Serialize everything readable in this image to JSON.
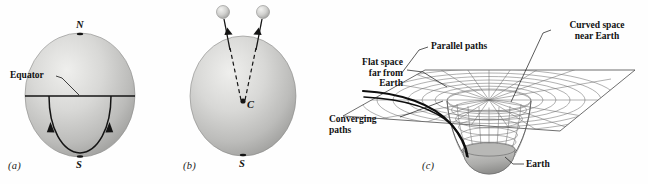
{
  "figure": {
    "title_implicit": "Gravitation and curved space near Earth",
    "background_color": "#fefefe",
    "ink_color": "#111111",
    "sphere_fill_light": "#e8e8e6",
    "sphere_fill_mid": "#c3c3c1",
    "sphere_fill_dark": "#9a9a98",
    "grid_color": "#6f6f6f",
    "earth_fill": "#a9a9a7"
  },
  "panels": [
    {
      "id": "a",
      "label": "(a)",
      "labels": {
        "north_pole": "N",
        "south_pole": "S",
        "equator": "Equator"
      }
    },
    {
      "id": "b",
      "label": "(b)",
      "labels": {
        "center": "C",
        "south_pole": "S"
      },
      "apples_count": 2
    },
    {
      "id": "c",
      "label": "(c)",
      "labels": {
        "flat_space": "Flat space\nfar from\nEarth",
        "parallel_paths": "Parallel paths",
        "curved_space": "Curved space\nnear Earth",
        "converging_paths": "Converging\npaths",
        "earth": "Earth"
      }
    }
  ]
}
